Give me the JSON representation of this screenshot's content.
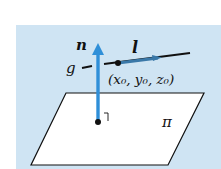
{
  "diagram": {
    "background_color": "#cfe4f3",
    "vector_color": "#2f8fd8",
    "line_color": "#111111",
    "labels": {
      "normal_vector": "n",
      "direction_vector": "l",
      "line": "g",
      "point": "(x₀, y₀, z₀)",
      "point_x": "x",
      "point_y": "y",
      "point_z": "z",
      "subscript": "0",
      "plane": "π"
    }
  }
}
